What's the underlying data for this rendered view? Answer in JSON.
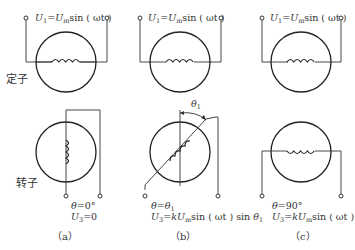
{
  "labels": {
    "stator": "定子",
    "rotor": "转子"
  },
  "panels": [
    {
      "id": "a",
      "caption": "（a）",
      "stator_voltage": {
        "U": "U",
        "sub1": "1",
        "eq": "=",
        "Um": "U",
        "subm": "m",
        "rest": "sin ( ωt )"
      },
      "theta_line": {
        "theta": "θ",
        "eq": "=0°"
      },
      "output_line": {
        "U": "U",
        "sub": "3",
        "rest": "=0"
      },
      "rotor_angle_deg": 0
    },
    {
      "id": "b",
      "caption": "（b）",
      "stator_voltage": {
        "U": "U",
        "sub1": "1",
        "eq": "=",
        "Um": "U",
        "subm": "m",
        "rest": "sin ( ωt )"
      },
      "theta_line": {
        "theta": "θ",
        "eq": "=",
        "theta1": "θ",
        "sub1": "1"
      },
      "output_line": {
        "U": "U",
        "sub": "3",
        "eq": "=",
        "k": "k",
        "Um": "U",
        "subm": "m",
        "rest": "sin ( ωt ) sin ",
        "theta1": "θ",
        "sub1": "1"
      },
      "angle_label": {
        "theta": "θ",
        "sub": "1"
      },
      "rotor_angle_deg": 45
    },
    {
      "id": "c",
      "caption": "（c）",
      "stator_voltage": {
        "U": "U",
        "sub1": "1",
        "eq": "=",
        "Um": "U",
        "subm": "m",
        "rest": "sin ( ωt )"
      },
      "theta_line": {
        "theta": "θ",
        "eq": "=90°"
      },
      "output_line": {
        "U": "U",
        "sub": "3",
        "eq": "=",
        "k": "k",
        "Um": "U",
        "subm": "m",
        "rest": "sin ( ωt )"
      },
      "rotor_angle_deg": 90
    }
  ]
}
